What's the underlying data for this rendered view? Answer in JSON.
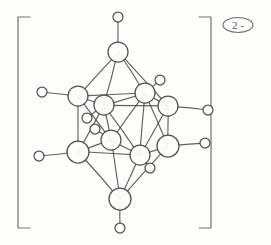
{
  "figure": {
    "kind": "hand-drawn chemical structure sketch",
    "formula_label": "",
    "medium_color": "#4a4a4a",
    "paper_color": "#fdfdfc"
  },
  "charge_label": {
    "text": "2 -",
    "shape": "ellipse",
    "position": "top-right outside bracket"
  },
  "brackets": {
    "left": {
      "x": 18,
      "top": 17,
      "bottom": 228,
      "foot": 12
    },
    "right": {
      "x": 211,
      "top": 17,
      "bottom": 228,
      "foot": 12
    }
  },
  "chart_data": {
    "type": "diagram",
    "title": "",
    "vertex_radius_boron": 9,
    "vertex_radius_hydrogen": 5,
    "boron_vertices": [
      {
        "id": "B1",
        "label": "",
        "x": 118,
        "y": 52,
        "r": 10,
        "role": "top-apex"
      },
      {
        "id": "B2",
        "label": "",
        "x": 78,
        "y": 96,
        "r": 10,
        "role": "upper-belt-left"
      },
      {
        "id": "B3",
        "label": "",
        "x": 104,
        "y": 105,
        "r": 10,
        "role": "upper-belt-front-left"
      },
      {
        "id": "B4",
        "label": "",
        "x": 145,
        "y": 93,
        "r": 10,
        "role": "upper-belt-back-right"
      },
      {
        "id": "B5",
        "label": "",
        "x": 168,
        "y": 106,
        "r": 10,
        "role": "upper-belt-right"
      },
      {
        "id": "B6",
        "label": "",
        "x": 111,
        "y": 140,
        "r": 10,
        "role": "lower-belt-front-left"
      },
      {
        "id": "B7",
        "label": "",
        "x": 78,
        "y": 152,
        "r": 11,
        "role": "lower-belt-left"
      },
      {
        "id": "B8",
        "label": "",
        "x": 140,
        "y": 155,
        "r": 10,
        "role": "lower-belt-front-right"
      },
      {
        "id": "B9",
        "label": "",
        "x": 168,
        "y": 146,
        "r": 11,
        "role": "lower-belt-right"
      },
      {
        "id": "B10",
        "label": "",
        "x": 120,
        "y": 199,
        "r": 11,
        "role": "bottom-apex"
      }
    ],
    "hydrogen_vertices": [
      {
        "id": "H1",
        "label": "",
        "x": 118,
        "y": 17,
        "r": 5,
        "bonded_to": "B1"
      },
      {
        "id": "H2",
        "label": "",
        "x": 42,
        "y": 92,
        "r": 5,
        "bonded_to": "B2"
      },
      {
        "id": "H3",
        "label": "",
        "x": 87,
        "y": 118,
        "r": 5,
        "bonded_to": "B3"
      },
      {
        "id": "H4",
        "label": "",
        "x": 160,
        "y": 80,
        "r": 5,
        "bonded_to": "B4"
      },
      {
        "id": "H5",
        "label": "",
        "x": 208,
        "y": 110,
        "r": 5,
        "bonded_to": "B5"
      },
      {
        "id": "H6",
        "label": "",
        "x": 95,
        "y": 129,
        "r": 5,
        "bonded_to": "B6"
      },
      {
        "id": "H7",
        "label": "",
        "x": 39,
        "y": 156,
        "r": 5,
        "bonded_to": "B7"
      },
      {
        "id": "H8",
        "label": "",
        "x": 150,
        "y": 168,
        "r": 5,
        "bonded_to": "B8"
      },
      {
        "id": "H9",
        "label": "",
        "x": 205,
        "y": 143,
        "r": 5,
        "bonded_to": "B9"
      },
      {
        "id": "H10",
        "label": "",
        "x": 120,
        "y": 228,
        "r": 5,
        "bonded_to": "B10"
      }
    ],
    "cage_bonds": [
      [
        "B1",
        "B2"
      ],
      [
        "B1",
        "B3"
      ],
      [
        "B1",
        "B4"
      ],
      [
        "B1",
        "B5"
      ],
      [
        "B2",
        "B3"
      ],
      [
        "B3",
        "B4"
      ],
      [
        "B4",
        "B5"
      ],
      [
        "B2",
        "B4"
      ],
      [
        "B3",
        "B5"
      ],
      [
        "B2",
        "B6"
      ],
      [
        "B2",
        "B7"
      ],
      [
        "B3",
        "B6"
      ],
      [
        "B3",
        "B7"
      ],
      [
        "B4",
        "B8"
      ],
      [
        "B4",
        "B9"
      ],
      [
        "B5",
        "B8"
      ],
      [
        "B5",
        "B9"
      ],
      [
        "B3",
        "B8"
      ],
      [
        "B4",
        "B6"
      ],
      [
        "B6",
        "B7"
      ],
      [
        "B6",
        "B8"
      ],
      [
        "B8",
        "B9"
      ],
      [
        "B7",
        "B8"
      ],
      [
        "B7",
        "B10"
      ],
      [
        "B6",
        "B10"
      ],
      [
        "B8",
        "B10"
      ],
      [
        "B9",
        "B10"
      ]
    ]
  }
}
